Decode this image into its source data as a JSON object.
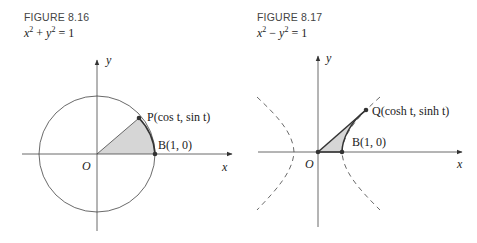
{
  "figures": [
    {
      "title": "FIGURE 8.16",
      "equation": {
        "lhs_a": "x",
        "op": "+",
        "lhs_b": "y",
        "rhs": "= 1",
        "full": "x² + y² = 1"
      },
      "labels": {
        "y_axis": "y",
        "x_axis": "x",
        "origin": "O",
        "point_p": "P(cos t, sin t)",
        "point_b": "B(1, 0)"
      },
      "curve": "unit circle",
      "shaded_region": "sector OBP"
    },
    {
      "title": "FIGURE 8.17",
      "equation": {
        "lhs_a": "x",
        "op": "−",
        "lhs_b": "y",
        "rhs": "= 1",
        "full": "x² − y² = 1"
      },
      "labels": {
        "y_axis": "y",
        "x_axis": "x",
        "origin": "O",
        "point_q": "Q(cosh t, sinh t)",
        "point_b": "B(1, 0)"
      },
      "curve": "unit hyperbola (dashed)",
      "shaded_region": "region OBQ"
    }
  ],
  "colors": {
    "line": "#333333",
    "shade": "#d6d6d6",
    "title": "#444444"
  }
}
